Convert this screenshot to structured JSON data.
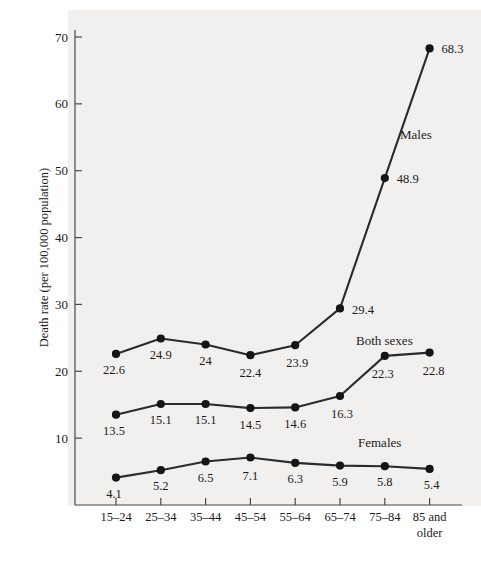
{
  "chart_data": {
    "type": "line",
    "title": "",
    "xlabel": "",
    "ylabel": "Death rate (per 100,000 population)",
    "categories": [
      "15–24",
      "25–34",
      "35–44",
      "45–54",
      "55–64",
      "65–74",
      "75–84",
      "85 and older"
    ],
    "xtick_labels": [
      "15–24",
      "25–34",
      "35–44",
      "45–54",
      "55–64",
      "65–74",
      "75–84",
      "85 and"
    ],
    "xtick_labels_line2": [
      "",
      "",
      "",
      "",
      "",
      "",
      "",
      "older"
    ],
    "ylim": [
      0,
      72
    ],
    "yticks": [
      10,
      20,
      30,
      40,
      50,
      60,
      70
    ],
    "ytick_labels": [
      "10",
      "20",
      "30",
      "40",
      "50",
      "60",
      "70"
    ],
    "grid": false,
    "legend_position": "inline-annotations",
    "series": [
      {
        "name": "Males",
        "values": [
          22.6,
          24.9,
          24,
          22.4,
          23.9,
          29.4,
          48.9,
          68.3
        ],
        "value_labels": [
          "22.6",
          "24.9",
          "24",
          "22.4",
          "23.9",
          "29.4",
          "48.9",
          "68.3"
        ],
        "color": "#2b2b2b"
      },
      {
        "name": "Both sexes",
        "values": [
          13.5,
          15.1,
          15.1,
          14.5,
          14.6,
          16.3,
          22.3,
          22.8
        ],
        "value_labels": [
          "13.5",
          "15.1",
          "15.1",
          "14.5",
          "14.6",
          "16.3",
          "22.3",
          "22.8"
        ],
        "color": "#2b2b2b"
      },
      {
        "name": "Females",
        "values": [
          4.1,
          5.2,
          6.5,
          7.1,
          6.3,
          5.9,
          5.8,
          5.4
        ],
        "value_labels": [
          "4.1",
          "5.2",
          "6.5",
          "7.1",
          "6.3",
          "5.9",
          "5.8",
          "5.4"
        ],
        "color": "#2b2b2b"
      }
    ],
    "annotations": [
      {
        "text": "Males",
        "x": 400,
        "y": 139
      },
      {
        "text": "Both sexes",
        "x": 356,
        "y": 345
      },
      {
        "text": "Females",
        "x": 358,
        "y": 447
      }
    ]
  }
}
